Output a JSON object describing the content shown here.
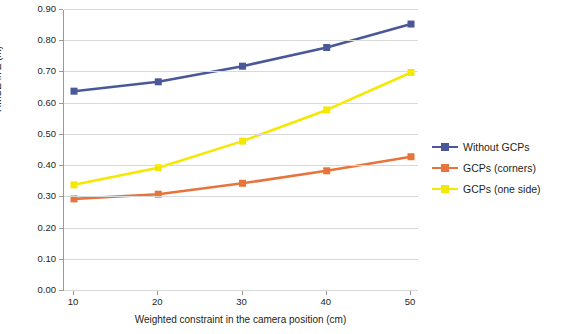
{
  "chart_data": {
    "type": "line",
    "title": "",
    "xlabel": "Weighted constraint in the camera position (cm)",
    "ylabel": "RMSE in Z (m)",
    "x": [
      10,
      20,
      30,
      40,
      50
    ],
    "xticklabels": [
      "10",
      "20",
      "30",
      "40",
      "50"
    ],
    "yticklabels": [
      "0.00",
      "0.10",
      "0.20",
      "0.30",
      "0.40",
      "0.50",
      "0.60",
      "0.70",
      "0.80",
      "0.90"
    ],
    "ylim": [
      0.0,
      0.9
    ],
    "ytick_step": 0.1,
    "grid": "horizontal",
    "legend_position": "right",
    "series": [
      {
        "name": "Without GCPs",
        "color": "#4a5899",
        "marker": "square",
        "values": [
          0.64,
          0.67,
          0.72,
          0.78,
          0.855
        ]
      },
      {
        "name": "GCPs (corners)",
        "color": "#e8743b",
        "marker": "square",
        "values": [
          0.295,
          0.31,
          0.345,
          0.385,
          0.43
        ]
      },
      {
        "name": "GCPs (one side)",
        "color": "#f5e800",
        "marker": "square",
        "values": [
          0.34,
          0.395,
          0.48,
          0.58,
          0.7
        ]
      }
    ]
  },
  "axis": {
    "y_title": "RMSE in Z (m)",
    "x_title": "Weighted constraint in the camera position (cm)"
  },
  "legend": {
    "items": [
      {
        "label": "Without GCPs",
        "color": "#4a5899"
      },
      {
        "label": "GCPs (corners)",
        "color": "#e8743b"
      },
      {
        "label": "GCPs (one side)",
        "color": "#f5e800"
      }
    ]
  }
}
